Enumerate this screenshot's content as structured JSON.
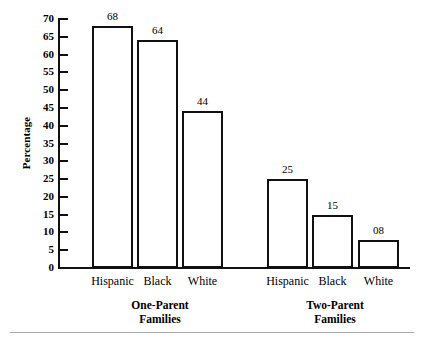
{
  "chart_data": {
    "type": "bar",
    "title": "",
    "xlabel": "",
    "ylabel": "Percentage",
    "ylim": [
      0,
      70
    ],
    "ytick_step": 5,
    "yticks": [
      70,
      65,
      60,
      55,
      50,
      45,
      40,
      35,
      30,
      25,
      20,
      15,
      10,
      5,
      0
    ],
    "grid": false,
    "legend": "none",
    "categories": [
      "Hispanic",
      "Black",
      "White"
    ],
    "groups": [
      {
        "name": "One-Parent Families",
        "label_line1": "One-Parent",
        "label_line2": "Families",
        "bars": [
          {
            "category": "Hispanic",
            "value": 68,
            "value_label": "68"
          },
          {
            "category": "Black",
            "value": 64,
            "value_label": "64"
          },
          {
            "category": "White",
            "value": 44,
            "value_label": "44"
          }
        ]
      },
      {
        "name": "Two-Parent Families",
        "label_line1": "Two-Parent",
        "label_line2": "Families",
        "bars": [
          {
            "category": "Hispanic",
            "value": 25,
            "value_label": "25"
          },
          {
            "category": "Black",
            "value": 15,
            "value_label": "15"
          },
          {
            "category": "White",
            "value": 8,
            "value_label": "08"
          }
        ]
      }
    ],
    "colors": {
      "bar_fill": "#ffffff",
      "bar_stroke": "#111111",
      "axis": "#111111",
      "text": "#000000",
      "background": "#ffffff",
      "rule": "#aaaaac"
    }
  }
}
